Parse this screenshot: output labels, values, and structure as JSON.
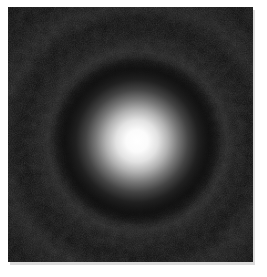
{
  "page": {
    "background_color": "#ffffff"
  },
  "image": {
    "description": "Grayscale diffraction pattern photograph: a bright white central Airy disk fading through gray into a dark ring, surrounded by a faint bright diffraction ring and a very faint outer ring, over a noisy near-black background",
    "width_px": "245",
    "height_px": "255",
    "background_color": "#0c0c0c",
    "center_x": "129",
    "center_y": "134",
    "core_color": "#ffffff",
    "glow_radius_px": "84",
    "dark_ring_radius_px": "105",
    "ring1_radius_px": "112",
    "ring2_radius_px": "160",
    "noise_fine_opacity": "0.16",
    "noise_coarse_opacity": "0.09"
  }
}
